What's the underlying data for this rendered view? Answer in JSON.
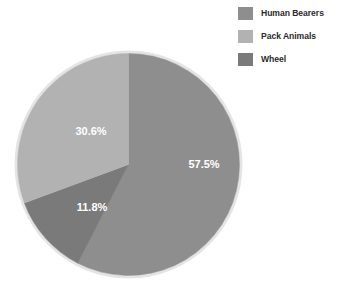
{
  "chart_data": {
    "type": "pie",
    "title": "",
    "categories": [
      "Human Bearers",
      "Pack Animals",
      "Wheel"
    ],
    "values": [
      57.5,
      30.6,
      11.8
    ],
    "value_labels": [
      "57.5%",
      "30.6%",
      "11.8%"
    ],
    "colors": [
      "#8e8e8e",
      "#b2b2b2",
      "#7a7a7a"
    ],
    "legend_position": "top-right",
    "start_angle_deg": 0,
    "direction": "clockwise",
    "grid": false,
    "units": "percent"
  },
  "legend": {
    "items": [
      {
        "label": "Human Bearers",
        "color": "#8e8e8e"
      },
      {
        "label": "Pack Animals",
        "color": "#b2b2b2"
      },
      {
        "label": "Wheel",
        "color": "#7a7a7a"
      }
    ]
  },
  "pie": {
    "slices": [
      {
        "name": "Human Bearers",
        "value_label": "57.5%"
      },
      {
        "name": "Pack Animals",
        "value_label": "30.6%"
      },
      {
        "name": "Wheel",
        "value_label": "11.8%"
      }
    ]
  },
  "colors": {
    "background": "#ffffff",
    "text": "#2b2b2b",
    "label_text": "#ffffff",
    "pie_outline": "#e2e2e2"
  }
}
